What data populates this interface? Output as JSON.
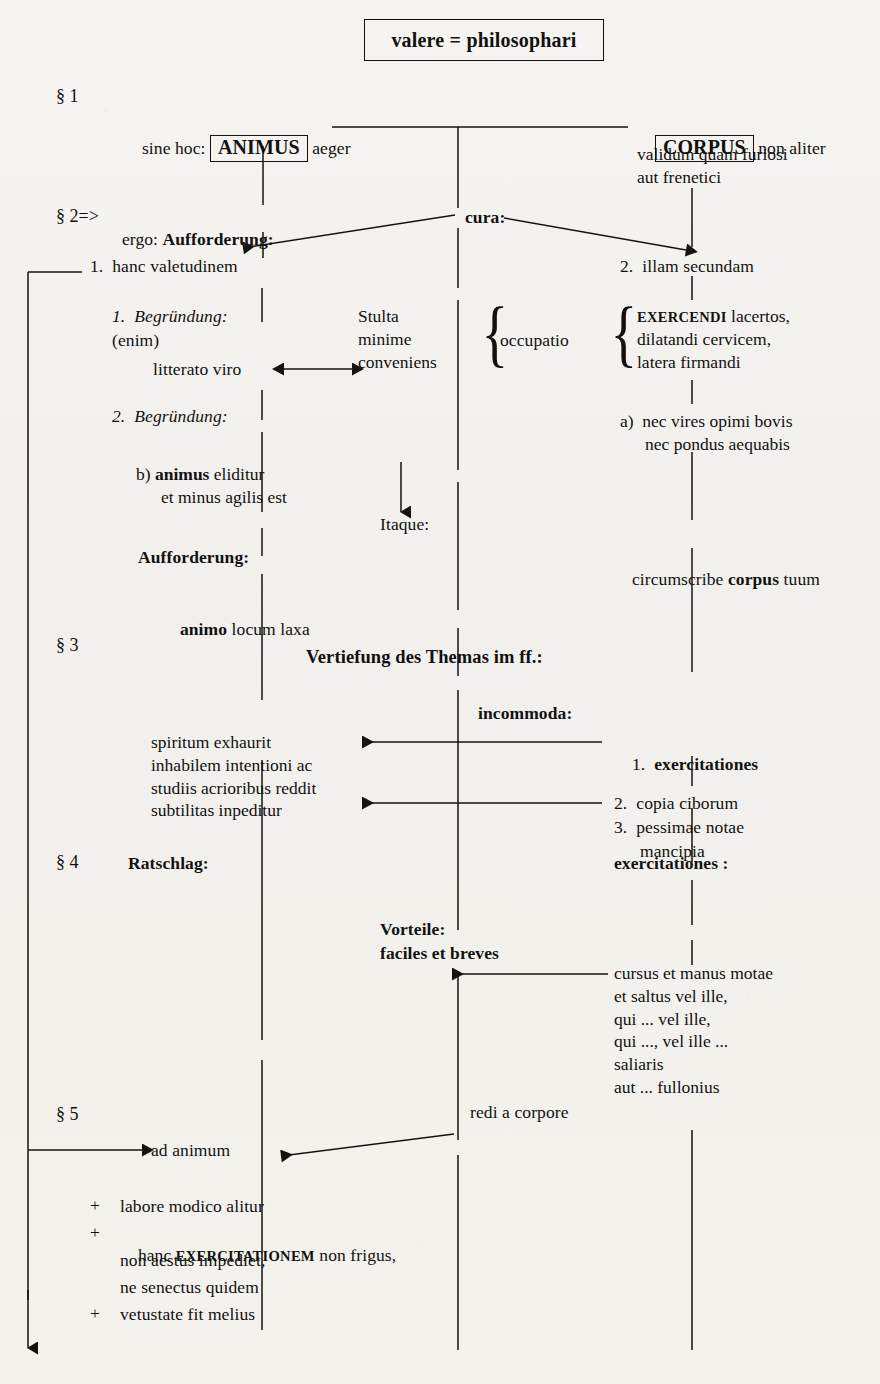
{
  "title": {
    "text": "valere = philosophari"
  },
  "sections": {
    "s1": "§ 1",
    "s2": "§ 2=>",
    "s3": "§ 3",
    "s4": "§ 4",
    "s5": "§ 5"
  },
  "s1": {
    "left_prefix": "sine hoc:",
    "left_keyword": "ANIMUS",
    "left_suffix": "aeger",
    "right_keyword": "CORPUS",
    "right_suffix": "non aliter",
    "right_line2": "validum quam furiosi",
    "right_line3": "aut freneticі"
  },
  "s2": {
    "ergo": "ergo:",
    "aufforderung": "Aufforderung:",
    "cura": "cura:",
    "item1": "1.  hanc valetudinem",
    "item2": "2.  illam secundam",
    "begruendung1": "1.  Begründung:",
    "enim": "(enim)",
    "litterato": "litterato viro",
    "stulta": "Stulta",
    "minime": "minime",
    "conveniens": "conveniens",
    "occupatio": "occupatio",
    "exercendi_sc": "EXERCENDI",
    "exercendi_rest": " lacertos,",
    "exercendi_l2": "dilatandi cervicem,",
    "exercendi_l3": "latera firmandi",
    "begruendung2": "2.  Begründung:",
    "a_line1": "a)  nec vires opimi bovis",
    "a_line2": "nec pondus aequabis",
    "b_label": "b)",
    "b_bold": "animus",
    "b_rest": " eliditur",
    "b_line2": "et minus agilis est",
    "itaque": "Itaque:",
    "aufforderung2": "Aufforderung:",
    "animo_bold": "animo",
    "animo_rest": " locum laxa",
    "circumscribe_pre": "circumscribe ",
    "circumscribe_bold": "corpus",
    "circumscribe_post": " tuum"
  },
  "s3": {
    "vertiefung": "Vertiefung des Themas im ff.:",
    "incommoda": "incommoda:",
    "left_l1": "spiritum exhaurit",
    "left_l2": "inhabilem intentioni ac",
    "left_l3": "studiis acrioribus reddit",
    "left_l4": "subtilitas inpeditur",
    "item1_num": "1.",
    "item1": "exercitationes",
    "item2": "2.  copia ciborum",
    "item3": "3.  pessimae notae",
    "item3_l2": "mancipia"
  },
  "s4": {
    "ratschlag": "Ratschlag:",
    "exercitationes": "exercitationes :",
    "vorteile": "Vorteile:",
    "faciles": "faciles et breves",
    "right_l1": "cursus et manus motae",
    "right_l2": "et saltus vel ille,",
    "right_l3": "qui ... vel ille,",
    "right_l4": "qui ..., vel ille ...",
    "right_l5": "saliaris",
    "right_l6": "aut ... fullonius"
  },
  "s5": {
    "redi": "redi a corpore",
    "ad_animum": "ad animum",
    "plus": "+",
    "p1": "labore modico alitur",
    "p2_pre": "hanc ",
    "p2_sc": "EXERCITATIONEM",
    "p2_post": " non frigus,",
    "p2_l2": "non aestus impediet,",
    "p2_l3": "ne senectus quidem",
    "p3": "vetustate fit melius"
  },
  "colors": {
    "ink": "#14110e",
    "paper": "#f4f2ee",
    "rule": "#2a2622"
  }
}
